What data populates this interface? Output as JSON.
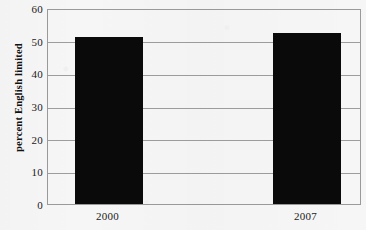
{
  "chart_data": {
    "type": "bar",
    "title": "",
    "subtitle": "",
    "xlabel": "",
    "ylabel": "percent English limited",
    "categories": [
      "2000",
      "2007"
    ],
    "values": [
      51,
      52.5
    ],
    "series": [
      {
        "name": "percent English limited",
        "values": [
          51,
          52.5
        ]
      }
    ],
    "ylim": [
      0,
      60
    ],
    "ytick_labels": [
      "0",
      "10",
      "20",
      "30",
      "40",
      "50",
      "60"
    ],
    "ytick_values": [
      0,
      10,
      20,
      30,
      40,
      50,
      60
    ],
    "grid": true,
    "grid_axis": "y",
    "legend": false,
    "legend_position": "none",
    "bar_color": "#0a0a0a",
    "grid_color": "#9d9d9d",
    "frame_color": "#9a9a9a",
    "background_color": "#f6f6f6",
    "text_color": "#1a1a1a"
  }
}
